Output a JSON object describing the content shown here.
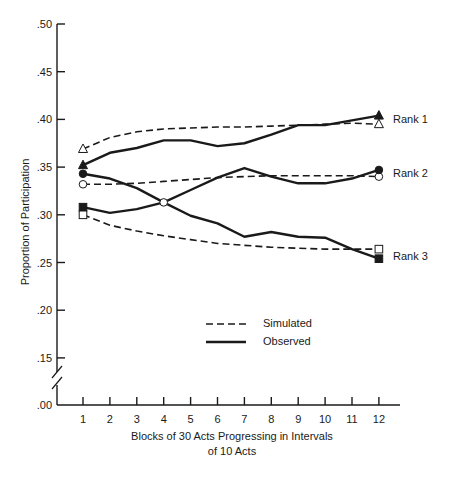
{
  "chart_data": {
    "type": "line",
    "title": "",
    "xlabel": "Blocks of 30 Acts Progressing in Intervals of 10 Acts",
    "xlabel_lines": [
      "Blocks of 30 Acts Progressing in Intervals",
      "of 10 Acts"
    ],
    "ylabel": "Proportion of Participation",
    "x": [
      1,
      2,
      3,
      4,
      5,
      6,
      7,
      8,
      9,
      10,
      11,
      12
    ],
    "y_ticks": [
      ".00",
      ".15",
      ".20",
      ".25",
      ".30",
      ".35",
      ".40",
      ".45",
      ".50"
    ],
    "y_tick_values": [
      0.0,
      0.15,
      0.2,
      0.25,
      0.3,
      0.35,
      0.4,
      0.45,
      0.5
    ],
    "ylim": [
      0.0,
      0.5
    ],
    "axis_break": "between .00 and .15",
    "grid": false,
    "legend": {
      "position": "center-lower",
      "entries": [
        {
          "label": "Simulated",
          "style": "dashed"
        },
        {
          "label": "Observed",
          "style": "solid"
        }
      ]
    },
    "series": [
      {
        "name": "Rank 1 Simulated",
        "style": "dashed",
        "marker": "open-triangle",
        "values": [
          0.369,
          0.381,
          0.387,
          0.39,
          0.391,
          0.392,
          0.392,
          0.393,
          0.394,
          0.395,
          0.396,
          0.395
        ]
      },
      {
        "name": "Rank 1 Observed",
        "style": "solid",
        "marker": "filled-triangle",
        "values": [
          0.352,
          0.365,
          0.37,
          0.378,
          0.378,
          0.372,
          0.375,
          0.384,
          0.394,
          0.394,
          0.399,
          0.404
        ]
      },
      {
        "name": "Rank 2 Simulated",
        "style": "dashed",
        "marker": "open-circle",
        "values": [
          0.332,
          0.332,
          0.333,
          0.335,
          0.337,
          0.339,
          0.34,
          0.341,
          0.341,
          0.341,
          0.341,
          0.34
        ]
      },
      {
        "name": "Observed (starts filled circle, ends filled square)",
        "style": "solid",
        "marker_start": "filled-circle",
        "marker_end": "filled-square",
        "values": [
          0.343,
          0.338,
          0.328,
          0.313,
          0.299,
          0.291,
          0.277,
          0.282,
          0.277,
          0.276,
          0.264,
          0.254
        ]
      },
      {
        "name": "Observed (starts filled square, ends filled circle)",
        "style": "solid",
        "marker_start": "filled-square",
        "marker_end": "filled-circle",
        "values": [
          0.308,
          0.302,
          0.306,
          0.313,
          0.326,
          0.339,
          0.349,
          0.34,
          0.333,
          0.333,
          0.338,
          0.347
        ]
      },
      {
        "name": "Rank 3 Simulated",
        "style": "dashed",
        "marker": "open-square",
        "values": [
          0.3,
          0.289,
          0.283,
          0.278,
          0.274,
          0.27,
          0.268,
          0.266,
          0.265,
          0.264,
          0.264,
          0.264
        ]
      }
    ],
    "annotations": [
      {
        "text": "Rank 1",
        "at": "right of x=12, y≈.40"
      },
      {
        "text": "Rank 2",
        "at": "right of x=12, y≈.345"
      },
      {
        "text": "Rank 3",
        "at": "right of x=12, y≈.26"
      }
    ]
  },
  "labels": {
    "ylabel": "Proportion of Participation",
    "xlabel_line1": "Blocks of 30 Acts Progressing in Intervals",
    "xlabel_line2": "of 10 Acts",
    "legend_simulated": "Simulated",
    "legend_observed": "Observed",
    "rank1": "Rank 1",
    "rank2": "Rank 2",
    "rank3": "Rank 3"
  }
}
